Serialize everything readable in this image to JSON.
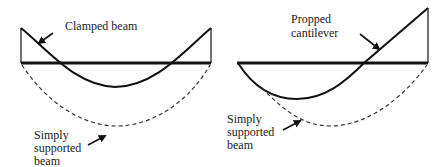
{
  "diagrams": [
    {
      "id": "left",
      "title": "Clamped beam vs simply supported beam moment diagrams",
      "labels": {
        "clamped": "Clamped beam",
        "simply_line1": "Simply",
        "simply_line2": "supported",
        "simply_line3": "beam"
      }
    },
    {
      "id": "right",
      "title": "Propped cantilever vs simply supported beam moment diagrams",
      "labels": {
        "propped_line1": "Propped",
        "propped_line2": "cantilever",
        "simply_line1": "Simply",
        "simply_line2": "supported",
        "simply_line3": "beam"
      }
    }
  ],
  "colors": {
    "line": "#111111",
    "dashed": "#333333",
    "background": "#ffffff"
  }
}
